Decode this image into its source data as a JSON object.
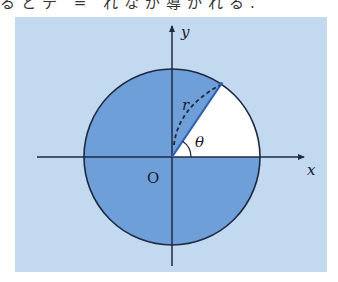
{
  "caption": {
    "text": "るとテ = れなが導かれる."
  },
  "diagram": {
    "background_color": "#c2d9f0",
    "fill_color": "#6f9fd8",
    "unshaded_color": "#ffffff",
    "line_color": "#1e2a44",
    "labels": {
      "x_axis": "x",
      "y_axis": "y",
      "origin": "O",
      "radius": "r",
      "angle": "θ"
    },
    "geometry": {
      "center": [
        172,
        157
      ],
      "radius": 88,
      "angle_deg": 56,
      "unshaded_sector": "from 0 to θ (first quadrant wedge)"
    }
  }
}
